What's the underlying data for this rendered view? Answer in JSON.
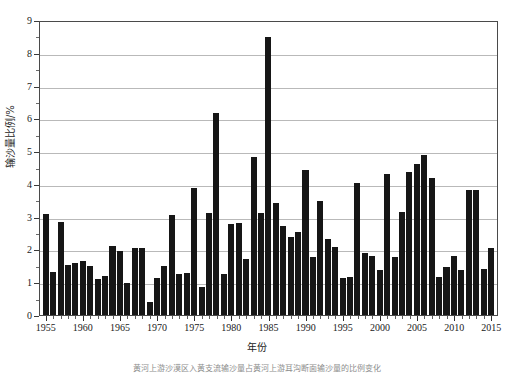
{
  "chart_data": {
    "type": "bar",
    "title": "",
    "xlabel": "年份",
    "ylabel": "输沙量比例/%",
    "ylim": [
      0,
      9
    ],
    "xlim": [
      1955,
      2015
    ],
    "grid": true,
    "legend": null,
    "y_ticks": [
      0,
      1,
      2,
      3,
      4,
      5,
      6,
      7,
      8,
      9
    ],
    "y_tick_labels": [
      "0",
      "1",
      "2",
      "3",
      "4",
      "5",
      "6",
      "7",
      "8",
      "9"
    ],
    "y_minor_ticks": [
      0.5,
      1.5,
      2.5,
      3.5,
      4.5,
      5.5,
      6.5,
      7.5,
      8.5
    ],
    "x_tick_labels": [
      "1955",
      "1960",
      "1965",
      "1970",
      "1975",
      "1980",
      "1985",
      "1990",
      "1995",
      "2000",
      "2005",
      "2010",
      "2015"
    ],
    "x_tick_values": [
      1955,
      1960,
      1965,
      1970,
      1975,
      1980,
      1985,
      1990,
      1995,
      2000,
      2005,
      2010,
      2015
    ],
    "bar_color": "#161616",
    "categories": [
      "1955",
      "1956",
      "1957",
      "1958",
      "1959",
      "1960",
      "1961",
      "1962",
      "1963",
      "1964",
      "1965",
      "1966",
      "1967",
      "1968",
      "1969",
      "1970",
      "1971",
      "1972",
      "1973",
      "1974",
      "1975",
      "1976",
      "1977",
      "1978",
      "1979",
      "1980",
      "1981",
      "1982",
      "1983",
      "1984",
      "1985",
      "1986",
      "1987",
      "1988",
      "1989",
      "1990",
      "1991",
      "1992",
      "1993",
      "1994",
      "1995",
      "1996",
      "1997",
      "1998",
      "1999",
      "2000",
      "2001",
      "2002",
      "2003",
      "2004",
      "2005",
      "2006",
      "2007",
      "2008",
      "2009",
      "2010",
      "2011",
      "2012",
      "2013",
      "2014",
      "2015"
    ],
    "values": [
      3.1,
      1.33,
      2.87,
      1.55,
      1.6,
      1.66,
      1.52,
      1.1,
      1.21,
      2.13,
      1.97,
      0.97,
      2.07,
      2.06,
      0.4,
      1.15,
      1.52,
      3.06,
      1.25,
      1.3,
      3.89,
      0.87,
      3.14,
      6.2,
      1.25,
      2.8,
      2.84,
      1.72,
      4.85,
      3.12,
      8.55,
      3.45,
      2.72,
      2.4,
      2.55,
      4.46,
      1.78,
      3.5,
      2.32,
      2.1,
      1.15,
      1.16,
      4.06,
      1.9,
      1.81,
      1.38,
      4.32,
      1.77,
      3.15,
      4.4,
      4.64,
      4.9,
      4.2,
      1.18,
      1.47,
      1.82,
      1.37,
      3.84,
      3.83,
      1.42,
      2.07
    ]
  },
  "caption": {
    "text": "黄河上游沙漠区入黄支流输沙量占黄河上游耳沟断面输沙量的比例变化"
  }
}
